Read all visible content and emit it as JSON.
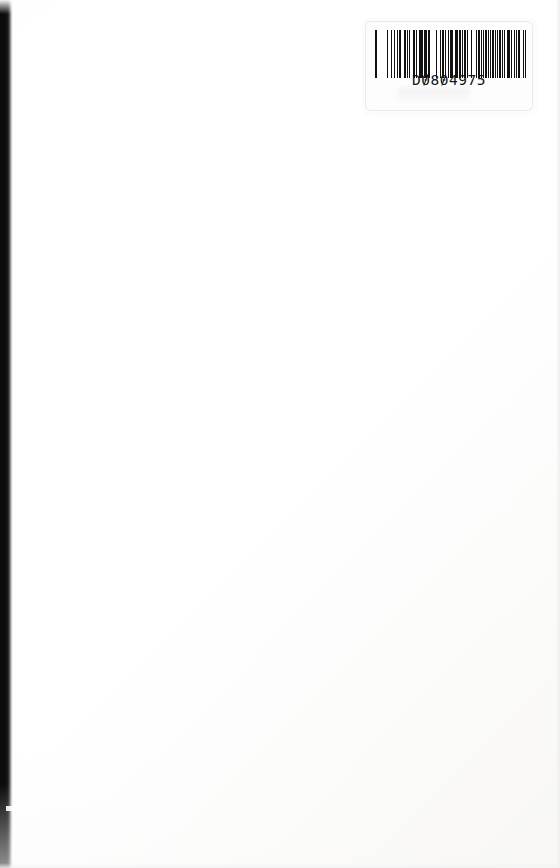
{
  "page": {
    "width": 560,
    "height": 868,
    "background_color": "#ffffff",
    "body_text": ""
  },
  "scan_artifacts": {
    "left_edge_label": "scanner edge shadow",
    "left_edge_color": "#0a0a0a",
    "left_edge_width_px": 13,
    "paper_tint": "#fdfdfd"
  },
  "barcode_label": {
    "name": "library barcode sticker",
    "code_text": "D0804975",
    "code_prefix": "D",
    "code_digits": "0804975",
    "symbology": "Code 39",
    "bar_color": "#111111",
    "label_background": "#fdfdfd",
    "bars": [
      3,
      2,
      1,
      3,
      1,
      2,
      1,
      3,
      2,
      1,
      1,
      2,
      1,
      4,
      1,
      2,
      2,
      1,
      3,
      1,
      1,
      2,
      3,
      1,
      2,
      1,
      1,
      3,
      1,
      1,
      2,
      2,
      1,
      3,
      1,
      1,
      3,
      2,
      1,
      1,
      2,
      1,
      3,
      1,
      1,
      2,
      1,
      3,
      2,
      1,
      1,
      2,
      2,
      1,
      3,
      1,
      1,
      3,
      1,
      2,
      1,
      1,
      2,
      3,
      1,
      1,
      2,
      1,
      3,
      2,
      1,
      1,
      3,
      1,
      2,
      1,
      1,
      2,
      1,
      3,
      1,
      2,
      2,
      1,
      3,
      1,
      1,
      2,
      1,
      1,
      3,
      2,
      1,
      2,
      1,
      1,
      3,
      1,
      2,
      1,
      1,
      2,
      3,
      1,
      1,
      2,
      1,
      3,
      1,
      1,
      2,
      2,
      1,
      3,
      1,
      1,
      2,
      1,
      3,
      1,
      1,
      2,
      2,
      1,
      1,
      3
    ]
  }
}
